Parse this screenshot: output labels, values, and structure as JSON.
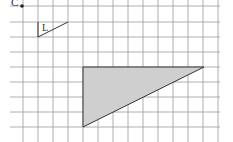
{
  "diagram": {
    "type": "grid-geometry",
    "grid": {
      "vertical_x": [
        23,
        38,
        53,
        68,
        83,
        98,
        113,
        128,
        143,
        158,
        173,
        188,
        203,
        218
      ],
      "horizontal_y": [
        6,
        22,
        37,
        52,
        67,
        82,
        97,
        112,
        127
      ],
      "line_color": "#9a9a9a"
    },
    "point_c": {
      "label": "C",
      "x": 22,
      "y": 6
    },
    "shape_l": {
      "label": "L",
      "points": "38,22 38,37 68,22"
    },
    "large_triangle": {
      "points": "83,67 83,127 204,67",
      "fill": "#cfcfcf",
      "stroke": "#333333"
    }
  }
}
